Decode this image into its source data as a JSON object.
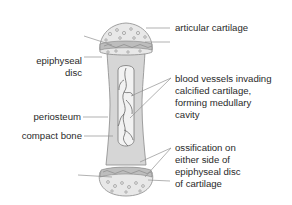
{
  "diagram": {
    "colors": {
      "bone_shaft": "#d6d6d6",
      "cavity": "#f0f0f0",
      "cartilage_cap": "#e8e8e8",
      "outline": "#888888",
      "leader": "#909090",
      "text": "#2a2a2a"
    },
    "labels": {
      "articular_cartilage": "articular cartilage",
      "epiphyseal_disc_line1": "epiphyseal",
      "epiphyseal_disc_line2": "disc",
      "blood_vessels_line1": "blood vessels invading",
      "blood_vessels_line2": "calcified cartilage,",
      "blood_vessels_line3": "forming medullary",
      "blood_vessels_line4": "cavity",
      "periosteum": "periosteum",
      "compact_bone": "compact bone",
      "ossification_line1": "ossification on",
      "ossification_line2": "either side of",
      "ossification_line3": "epiphyseal disc",
      "ossification_line4": "of cartilage"
    }
  }
}
